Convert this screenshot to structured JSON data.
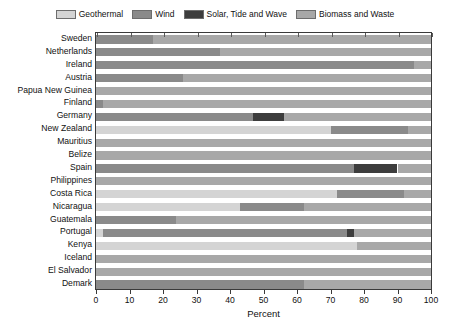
{
  "chart_data": {
    "type": "bar",
    "orientation": "horizontal",
    "stacked": true,
    "title": "",
    "xlabel": "Percent",
    "ylabel": "",
    "xlim": [
      0,
      100
    ],
    "xticks": [
      0,
      10,
      20,
      30,
      40,
      50,
      60,
      70,
      80,
      90,
      100
    ],
    "xticklabels": [
      "0",
      "10",
      "20",
      "30",
      "40",
      "50",
      "60",
      "70",
      "80",
      "90",
      "100"
    ],
    "grid": false,
    "legend_position": "top-center",
    "legend": [
      {
        "name": "Geothermal",
        "color": "#d4d4d4"
      },
      {
        "name": "Wind",
        "color": "#8a8a8a"
      },
      {
        "name": "Solar, Tide and Wave",
        "color": "#3d3d3d"
      },
      {
        "name": "Biomass and Waste",
        "color": "#a8a8a8"
      }
    ],
    "categories": [
      "Sweden",
      "Netherlands",
      "Ireland",
      "Austria",
      "Papua New Guinea",
      "Finland",
      "Germany",
      "New Zealand",
      "Mauritius",
      "Belize",
      "Spain",
      "Philippines",
      "Costa Rica",
      "Nicaragua",
      "Guatemala",
      "Portugal",
      "Kenya",
      "Iceland",
      "El Salvador",
      "Demark"
    ],
    "series": [
      {
        "name": "Geothermal",
        "color": "#d4d4d4",
        "values": [
          0,
          0,
          0,
          0,
          0,
          0,
          0,
          70,
          0,
          0,
          0,
          0,
          72,
          43,
          0,
          2,
          78,
          0,
          0,
          0
        ]
      },
      {
        "name": "Wind",
        "color": "#8a8a8a",
        "values": [
          17,
          37,
          95,
          26,
          0,
          2,
          47,
          23,
          0,
          0,
          77,
          0,
          20,
          19,
          24,
          73,
          0,
          0,
          0,
          62
        ]
      },
      {
        "name": "Solar, Tide and Wave",
        "color": "#3d3d3d",
        "values": [
          0,
          0,
          0,
          0,
          0,
          0,
          9,
          0,
          0,
          0,
          13,
          0,
          0,
          0,
          0,
          2,
          0,
          0,
          0,
          0
        ]
      },
      {
        "name": "Biomass and Waste",
        "color": "#a8a8a8",
        "values": [
          83,
          63,
          5,
          74,
          100,
          98,
          44,
          7,
          100,
          100,
          10,
          100,
          8,
          38,
          76,
          23,
          22,
          100,
          100,
          38
        ]
      }
    ]
  }
}
